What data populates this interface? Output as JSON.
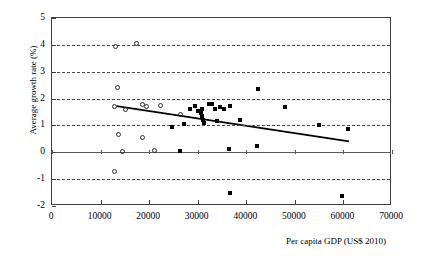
{
  "chart_data": {
    "type": "scatter",
    "title": "",
    "xlabel": "Per capita GDP (US$ 2010)",
    "ylabel": "Average growth rate (%)",
    "xlim": [
      0,
      70000
    ],
    "ylim": [
      -2,
      5
    ],
    "xticks": [
      0,
      10000,
      20000,
      30000,
      40000,
      50000,
      60000,
      70000
    ],
    "xtick_labels": [
      "0",
      "10000",
      "20000",
      "30000",
      "40000",
      "50000",
      "60000",
      "70000"
    ],
    "yticks": [
      -2,
      -1,
      0,
      1,
      2,
      3,
      4,
      5
    ],
    "ytick_labels": [
      "-2",
      "-1",
      "0",
      "1",
      "2",
      "3",
      "4",
      "5"
    ],
    "grid": "horizontal-dashed",
    "legend": "none",
    "series": [
      {
        "name": "open-circle-series",
        "marker": "open-circle",
        "color": "#2b2b2b",
        "points": [
          {
            "x": 13000,
            "y": 3.95
          },
          {
            "x": 17400,
            "y": 4.05
          },
          {
            "x": 13400,
            "y": 2.4
          },
          {
            "x": 12900,
            "y": 1.72
          },
          {
            "x": 15200,
            "y": 1.58
          },
          {
            "x": 18600,
            "y": 1.78
          },
          {
            "x": 19400,
            "y": 1.72
          },
          {
            "x": 22300,
            "y": 1.75
          },
          {
            "x": 26400,
            "y": 1.42
          },
          {
            "x": 13600,
            "y": 0.65
          },
          {
            "x": 18700,
            "y": 0.55
          },
          {
            "x": 14500,
            "y": 0.02
          },
          {
            "x": 21200,
            "y": 0.05
          },
          {
            "x": 12900,
            "y": -0.72
          }
        ]
      },
      {
        "name": "filled-square-series",
        "marker": "filled-square",
        "color": "#000000",
        "points": [
          {
            "x": 28400,
            "y": 1.62
          },
          {
            "x": 29400,
            "y": 1.72
          },
          {
            "x": 30000,
            "y": 1.55
          },
          {
            "x": 30600,
            "y": 1.45
          },
          {
            "x": 30800,
            "y": 1.62
          },
          {
            "x": 30900,
            "y": 1.35
          },
          {
            "x": 31000,
            "y": 1.22
          },
          {
            "x": 31200,
            "y": 1.1
          },
          {
            "x": 32400,
            "y": 1.78
          },
          {
            "x": 33000,
            "y": 1.8
          },
          {
            "x": 33500,
            "y": 1.62
          },
          {
            "x": 34600,
            "y": 1.68
          },
          {
            "x": 35400,
            "y": 1.6
          },
          {
            "x": 36600,
            "y": 1.72
          },
          {
            "x": 27100,
            "y": 1.05
          },
          {
            "x": 34000,
            "y": 1.18
          },
          {
            "x": 38800,
            "y": 1.22
          },
          {
            "x": 42500,
            "y": 2.35
          },
          {
            "x": 48000,
            "y": 1.7
          },
          {
            "x": 55000,
            "y": 1.0
          },
          {
            "x": 61000,
            "y": 0.85
          },
          {
            "x": 24800,
            "y": 0.95
          },
          {
            "x": 26400,
            "y": 0.05
          },
          {
            "x": 36500,
            "y": 0.12
          },
          {
            "x": 42200,
            "y": 0.25
          },
          {
            "x": 36700,
            "y": -1.5
          },
          {
            "x": 59800,
            "y": -1.62
          }
        ]
      }
    ],
    "trendline": {
      "name": "linear-fit",
      "color": "#000000",
      "x_start": 13400,
      "y_start": 1.68,
      "x_end": 61500,
      "y_end": 0.36
    }
  }
}
